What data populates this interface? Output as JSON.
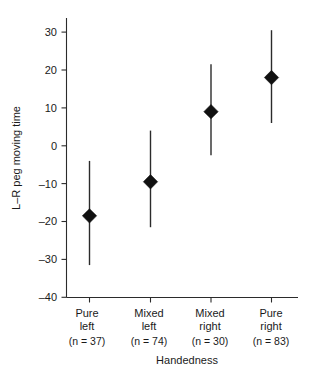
{
  "chart_data": {
    "type": "scatter",
    "title": "",
    "subtitle": "",
    "xlabel": "Handedness",
    "ylabel": "L–R peg moving time",
    "categories": [
      "Pure left",
      "Mixed left",
      "Mixed right",
      "Pure right"
    ],
    "category_lines": [
      [
        "Pure",
        "left"
      ],
      [
        "Mixed",
        "left"
      ],
      [
        "Mixed",
        "right"
      ],
      [
        "Pure",
        "right"
      ]
    ],
    "category_counts": [
      "(n = 37)",
      "(n = 74)",
      "(n = 30)",
      "(n = 83)"
    ],
    "n_values": [
      37,
      74,
      30,
      83
    ],
    "values": [
      -18.5,
      -9.5,
      9.0,
      18.0
    ],
    "error_low": [
      -31.5,
      -21.5,
      -2.5,
      6.0
    ],
    "error_high": [
      -4.0,
      4.0,
      21.5,
      30.5
    ],
    "series": [
      {
        "name": "L–R peg moving time",
        "values": [
          -18.5,
          -9.5,
          9.0,
          18.0
        ],
        "error_low": [
          -31.5,
          -21.5,
          -2.5,
          6.0
        ],
        "error_high": [
          -4.0,
          4.0,
          21.5,
          30.5
        ]
      }
    ],
    "ylim": [
      -40,
      34
    ],
    "yticks": [
      30,
      20,
      10,
      0,
      -10,
      -20,
      -30,
      -40
    ],
    "ytick_labels": [
      "30",
      "20",
      "10",
      "0",
      "–10",
      "–20",
      "–30",
      "–40"
    ],
    "grid": false,
    "legend": false,
    "marker_shape": "diamond",
    "marker_color": "#111111",
    "line_color": "#2b2b2b",
    "background_color": "#ffffff"
  }
}
